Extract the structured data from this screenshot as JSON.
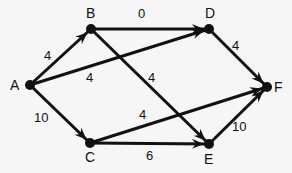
{
  "diagram": {
    "type": "directed-weighted-graph",
    "nodes": [
      {
        "id": "A",
        "label": "A",
        "x": 30,
        "y": 85,
        "lx": 10,
        "ly": 90
      },
      {
        "id": "B",
        "label": "B",
        "x": 91,
        "y": 29,
        "lx": 86,
        "ly": 18
      },
      {
        "id": "C",
        "label": "C",
        "x": 90,
        "y": 143,
        "lx": 85,
        "ly": 162
      },
      {
        "id": "D",
        "label": "D",
        "x": 209,
        "y": 29,
        "lx": 205,
        "ly": 18
      },
      {
        "id": "E",
        "label": "E",
        "x": 209,
        "y": 144,
        "lx": 204,
        "ly": 164
      },
      {
        "id": "F",
        "label": "F",
        "x": 267,
        "y": 87,
        "lx": 274,
        "ly": 92
      }
    ],
    "edges": [
      {
        "from": "A",
        "to": "B",
        "weight": "4",
        "lx": 44,
        "ly": 60
      },
      {
        "from": "A",
        "to": "D",
        "weight": "4",
        "lx": 86,
        "ly": 82
      },
      {
        "from": "A",
        "to": "C",
        "weight": "10",
        "lx": 34,
        "ly": 122
      },
      {
        "from": "B",
        "to": "D",
        "weight": "0",
        "lx": 138,
        "ly": 18
      },
      {
        "from": "B",
        "to": "E",
        "weight": "4",
        "lx": 148,
        "ly": 82
      },
      {
        "from": "D",
        "to": "F",
        "weight": "4",
        "lx": 232,
        "ly": 50
      },
      {
        "from": "C",
        "to": "F",
        "weight": "4",
        "lx": 139,
        "ly": 119
      },
      {
        "from": "C",
        "to": "E",
        "weight": "6",
        "lx": 146,
        "ly": 160
      },
      {
        "from": "E",
        "to": "F",
        "weight": "10",
        "lx": 232,
        "ly": 131
      }
    ],
    "colors": {
      "edge": "#111111",
      "node": "#111111",
      "background": "#f6f6f6"
    }
  }
}
